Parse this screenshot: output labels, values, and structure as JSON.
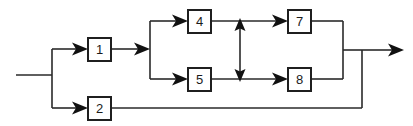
{
  "diagram": {
    "type": "block-flow-diagram",
    "background_color": "#ffffff",
    "line_color": "#2a2a2a",
    "box_fill": "#ffffff",
    "box_stroke": "#1f1f1f",
    "label_color": "#1a1a1a",
    "blocks": [
      {
        "id": "block-1",
        "label": "1",
        "x": 88,
        "y": 38,
        "w": 23,
        "h": 23
      },
      {
        "id": "block-2",
        "label": "2",
        "x": 88,
        "y": 97,
        "w": 23,
        "h": 23
      },
      {
        "id": "block-4",
        "label": "4",
        "x": 188,
        "y": 10,
        "w": 23,
        "h": 23
      },
      {
        "id": "block-5",
        "label": "5",
        "x": 188,
        "y": 68,
        "w": 23,
        "h": 23
      },
      {
        "id": "block-7",
        "label": "7",
        "x": 288,
        "y": 10,
        "w": 23,
        "h": 23
      },
      {
        "id": "block-8",
        "label": "8",
        "x": 288,
        "y": 68,
        "w": 23,
        "h": 23
      }
    ],
    "connections": [
      {
        "id": "input-line",
        "from": "input",
        "to": "splitter-1"
      },
      {
        "id": "splitter-1-up",
        "from": "splitter-1",
        "to": "block-1"
      },
      {
        "id": "splitter-1-down",
        "from": "splitter-1",
        "to": "block-2"
      },
      {
        "id": "block-1-out",
        "from": "block-1",
        "to": "splitter-2"
      },
      {
        "id": "splitter-2-up",
        "from": "splitter-2",
        "to": "block-4"
      },
      {
        "id": "splitter-2-down",
        "from": "splitter-2",
        "to": "block-5"
      },
      {
        "id": "block-4-to-7",
        "from": "block-4",
        "to": "block-7"
      },
      {
        "id": "block-5-to-8",
        "from": "block-5",
        "to": "block-8"
      },
      {
        "id": "cross-link",
        "from": "block-4-to-7",
        "to": "block-5-to-8",
        "bidirectional": true
      },
      {
        "id": "block-7-merge",
        "from": "block-7",
        "to": "merge-inner"
      },
      {
        "id": "block-8-merge",
        "from": "block-8",
        "to": "merge-inner"
      },
      {
        "id": "block-2-bypass",
        "from": "block-2",
        "to": "merge-outer"
      },
      {
        "id": "output-line",
        "from": "merge-outer",
        "to": "output"
      }
    ]
  }
}
